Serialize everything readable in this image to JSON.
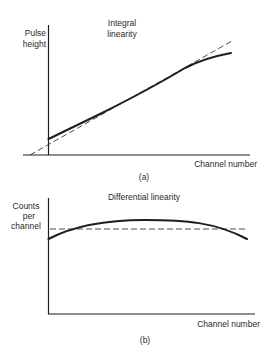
{
  "figure": {
    "panel_a": {
      "caption": "(a)",
      "title_line1": "Integral",
      "title_line2": "linearity",
      "ylabel_line1": "Pulse",
      "ylabel_line2": "height",
      "xlabel": "Channel number",
      "curves": [
        {
          "name": "measured response",
          "style": "solid",
          "description": "nearly linear, starts above origin, bends below ideal at high channels"
        },
        {
          "name": "ideal linear response",
          "style": "dashed",
          "description": "straight line through origin"
        }
      ]
    },
    "panel_b": {
      "caption": "(b)",
      "title": "Differential linearity",
      "ylabel_line1": "Counts",
      "ylabel_line2": "per",
      "ylabel_line3": "channel",
      "xlabel": "Channel number",
      "curves": [
        {
          "name": "measured counts per channel",
          "style": "solid",
          "description": "arched curve rising above then falling below ideal"
        },
        {
          "name": "ideal constant counts",
          "style": "dashed",
          "description": "horizontal line"
        }
      ]
    },
    "colors": {
      "ink": "#1e1e1e",
      "background": "#ffffff"
    }
  }
}
